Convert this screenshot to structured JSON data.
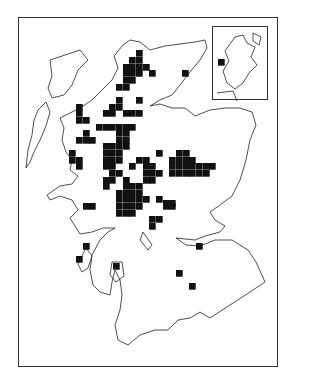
{
  "map": {
    "type": "distribution-map",
    "region": "Scotland",
    "cell_size": 6.7,
    "marker_color": "#111111",
    "outline_color": "#222222",
    "squares": [
      [
        136,
        50
      ],
      [
        129,
        57
      ],
      [
        136,
        57
      ],
      [
        123,
        64
      ],
      [
        129,
        64
      ],
      [
        136,
        64
      ],
      [
        143,
        64
      ],
      [
        149,
        70
      ],
      [
        182,
        70
      ],
      [
        123,
        70
      ],
      [
        129,
        70
      ],
      [
        136,
        70
      ],
      [
        123,
        77
      ],
      [
        129,
        77
      ],
      [
        116,
        84
      ],
      [
        123,
        84
      ],
      [
        116,
        97
      ],
      [
        136,
        97
      ],
      [
        109,
        104
      ],
      [
        116,
        104
      ],
      [
        103,
        110
      ],
      [
        109,
        110
      ],
      [
        123,
        110
      ],
      [
        129,
        110
      ],
      [
        136,
        110
      ],
      [
        76,
        104
      ],
      [
        76,
        110
      ],
      [
        76,
        117
      ],
      [
        83,
        117
      ],
      [
        96,
        124
      ],
      [
        103,
        124
      ],
      [
        109,
        124
      ],
      [
        116,
        124
      ],
      [
        123,
        124
      ],
      [
        129,
        124
      ],
      [
        83,
        130
      ],
      [
        116,
        130
      ],
      [
        123,
        130
      ],
      [
        76,
        137
      ],
      [
        83,
        137
      ],
      [
        89,
        137
      ],
      [
        116,
        137
      ],
      [
        123,
        137
      ],
      [
        69,
        150
      ],
      [
        103,
        143
      ],
      [
        109,
        143
      ],
      [
        116,
        143
      ],
      [
        123,
        143
      ],
      [
        103,
        150
      ],
      [
        109,
        150
      ],
      [
        116,
        150
      ],
      [
        156,
        150
      ],
      [
        176,
        150
      ],
      [
        183,
        150
      ],
      [
        69,
        157
      ],
      [
        76,
        157
      ],
      [
        103,
        157
      ],
      [
        109,
        157
      ],
      [
        116,
        157
      ],
      [
        136,
        157
      ],
      [
        143,
        157
      ],
      [
        169,
        157
      ],
      [
        176,
        157
      ],
      [
        183,
        157
      ],
      [
        189,
        157
      ],
      [
        76,
        163
      ],
      [
        103,
        163
      ],
      [
        109,
        163
      ],
      [
        129,
        163
      ],
      [
        143,
        163
      ],
      [
        149,
        163
      ],
      [
        169,
        163
      ],
      [
        176,
        163
      ],
      [
        183,
        163
      ],
      [
        189,
        163
      ],
      [
        196,
        163
      ],
      [
        203,
        163
      ],
      [
        209,
        163
      ],
      [
        109,
        170
      ],
      [
        116,
        170
      ],
      [
        143,
        170
      ],
      [
        149,
        170
      ],
      [
        156,
        170
      ],
      [
        169,
        170
      ],
      [
        176,
        170
      ],
      [
        183,
        170
      ],
      [
        189,
        170
      ],
      [
        196,
        170
      ],
      [
        203,
        170
      ],
      [
        103,
        177
      ],
      [
        109,
        177
      ],
      [
        123,
        177
      ],
      [
        143,
        177
      ],
      [
        149,
        177
      ],
      [
        103,
        183
      ],
      [
        123,
        183
      ],
      [
        129,
        183
      ],
      [
        136,
        183
      ],
      [
        116,
        190
      ],
      [
        123,
        190
      ],
      [
        129,
        190
      ],
      [
        136,
        190
      ],
      [
        156,
        196
      ],
      [
        163,
        200
      ],
      [
        169,
        200
      ],
      [
        116,
        196
      ],
      [
        123,
        196
      ],
      [
        129,
        196
      ],
      [
        136,
        196
      ],
      [
        143,
        196
      ],
      [
        83,
        203
      ],
      [
        89,
        203
      ],
      [
        116,
        203
      ],
      [
        123,
        203
      ],
      [
        129,
        203
      ],
      [
        136,
        203
      ],
      [
        163,
        203
      ],
      [
        169,
        203
      ],
      [
        116,
        210
      ],
      [
        123,
        210
      ],
      [
        129,
        210
      ],
      [
        149,
        216
      ],
      [
        156,
        216
      ],
      [
        149,
        223
      ],
      [
        196,
        243
      ],
      [
        83,
        243
      ],
      [
        76,
        256
      ],
      [
        113,
        263
      ],
      [
        176,
        270
      ],
      [
        189,
        283
      ]
    ],
    "inset": {
      "label": "Shetland/Orkney inset",
      "squares": [
        [
          217,
          60
        ]
      ]
    }
  }
}
